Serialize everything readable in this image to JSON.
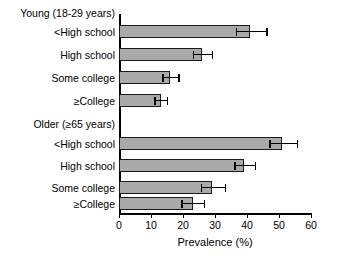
{
  "chart_data": {
    "type": "bar",
    "orientation": "horizontal",
    "title": "",
    "xlabel": "Prevalence (%)",
    "ylabel": "",
    "xlim": [
      0,
      60
    ],
    "xticks": [
      0,
      10,
      20,
      30,
      40,
      50,
      60
    ],
    "xtick_labels": [
      "0",
      "10",
      "20",
      "30",
      "40",
      "50",
      "60"
    ],
    "grid": false,
    "legend": "none",
    "bar_color": "#a9a9a9",
    "bar_edge_color": "#1a1a1a",
    "error_bar_color": "#000000",
    "groups": [
      {
        "name": "Young (18-29 years)",
        "categories": [
          "<High school",
          "High school",
          "Some college",
          "≥College"
        ],
        "values": [
          41,
          26,
          16,
          13
        ],
        "errors_upper": [
          46,
          29,
          18.5,
          15
        ],
        "errors_lower": [
          36.5,
          23,
          13.5,
          11
        ]
      },
      {
        "name": "Older (≥65 years)",
        "categories": [
          "<High school",
          "High school",
          "Some college",
          "≥College"
        ],
        "values": [
          51,
          39,
          29,
          23
        ],
        "errors_upper": [
          55.5,
          42.5,
          33,
          26.5
        ],
        "errors_lower": [
          47,
          36,
          25.5,
          19.5
        ]
      }
    ]
  },
  "axis": {
    "x_title": "Prevalence (%)"
  }
}
